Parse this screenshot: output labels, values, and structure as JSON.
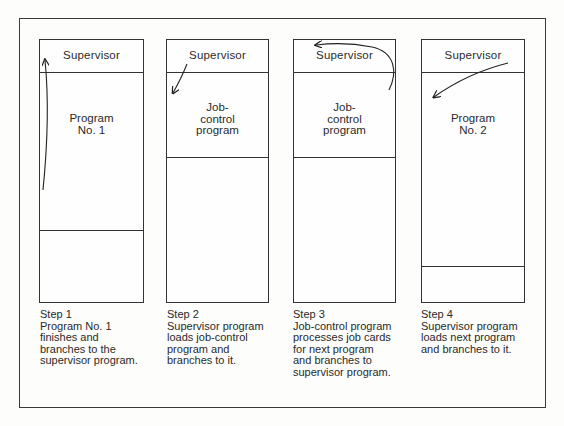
{
  "diagram": {
    "steps": [
      {
        "supervisor_label": "Supervisor",
        "program_label": "Program\nNo. 1",
        "caption_title": "Step 1",
        "caption_lines": [
          "Program No. 1",
          "finishes and",
          "branches to the",
          "supervisor program."
        ],
        "arrow": "program-to-supervisor"
      },
      {
        "supervisor_label": "Supervisor",
        "program_label": "Job-\ncontrol\nprogram",
        "caption_title": "Step 2",
        "caption_lines": [
          "Supervisor program",
          "loads job-control",
          "program and",
          "branches to it."
        ],
        "arrow": "supervisor-to-program"
      },
      {
        "supervisor_label": "Supervisor",
        "program_label": "Job-\ncontrol\nprogram",
        "caption_title": "Step 3",
        "caption_lines": [
          "Job-control program",
          "processes job cards",
          "for next program",
          "and branches to",
          "supervisor program."
        ],
        "arrow": "program-to-supervisor"
      },
      {
        "supervisor_label": "Supervisor",
        "program_label": "Program\nNo. 2",
        "caption_title": "Step 4",
        "caption_lines": [
          "Supervisor program",
          "loads next program",
          "and branches to it."
        ],
        "arrow": "supervisor-to-program"
      }
    ],
    "colors": {
      "line": "#333333",
      "background": "#fdfdfb",
      "text": "#2a2a2a"
    }
  }
}
